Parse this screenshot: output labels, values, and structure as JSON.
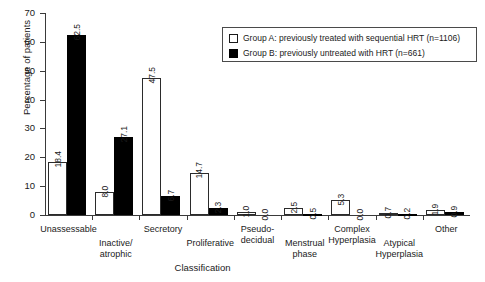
{
  "chart_data": {
    "type": "bar",
    "title": "",
    "xlabel": "Classification",
    "ylabel": "Percentage of patients",
    "ylim": [
      0,
      70
    ],
    "ytick_values": [
      0,
      10,
      20,
      30,
      40,
      50,
      60,
      70
    ],
    "grid": false,
    "legend_position": "top-right",
    "categories": [
      "Unassessable",
      "Inactive/\natrophic",
      "Secretory",
      "Proliferative",
      "Pseudo-\ndecidual",
      "Menstrual\nphase",
      "Complex\nHyperplasia",
      "Atypical\nHyperplasia",
      "Other"
    ],
    "series": [
      {
        "name": "Group A: previously treated with sequential HRT (n=1106)",
        "short_name": "Group A",
        "color": "#ffffff",
        "values": [
          18.4,
          8.0,
          47.5,
          14.7,
          1.0,
          2.5,
          5.3,
          0.7,
          1.9
        ]
      },
      {
        "name": "Group B: previously untreated with HRT (n=661)",
        "short_name": "Group B",
        "color": "#000000",
        "values": [
          62.5,
          27.1,
          6.7,
          2.3,
          0.0,
          0.5,
          0.0,
          0.2,
          0.9
        ]
      }
    ],
    "value_labels": [
      "18.4",
      "62.5",
      "8.0",
      "27.1",
      "47.5",
      "6.7",
      "14.7",
      "2.3",
      "1.0",
      "0.0",
      "2.5",
      "0.5",
      "5.3",
      "0.0",
      "0.7",
      "0.2",
      "1.9",
      "0.9"
    ]
  },
  "legend": {
    "entries": [
      {
        "swatch": "open-square",
        "text": "Group A: previously treated with sequential HRT (n=1106)"
      },
      {
        "swatch": "filled-square",
        "text": "Group B: previously untreated with HRT (n=661)"
      }
    ]
  }
}
